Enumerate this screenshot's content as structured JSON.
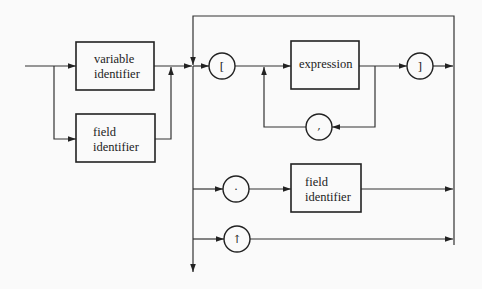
{
  "diagram": {
    "type": "syntax-diagram",
    "boxes": [
      {
        "id": "variable_identifier",
        "lines": [
          "variable",
          "identifier"
        ]
      },
      {
        "id": "field_identifier_left",
        "lines": [
          "field",
          "identifier"
        ]
      },
      {
        "id": "expression",
        "lines": [
          "expression"
        ]
      },
      {
        "id": "field_identifier_right",
        "lines": [
          "field",
          "identifier"
        ]
      }
    ],
    "terminals": [
      {
        "id": "open_bracket",
        "symbol": "["
      },
      {
        "id": "close_bracket",
        "symbol": "]"
      },
      {
        "id": "comma",
        "symbol": ","
      },
      {
        "id": "period",
        "symbol": "."
      },
      {
        "id": "pointer",
        "symbol": "↑"
      }
    ]
  }
}
